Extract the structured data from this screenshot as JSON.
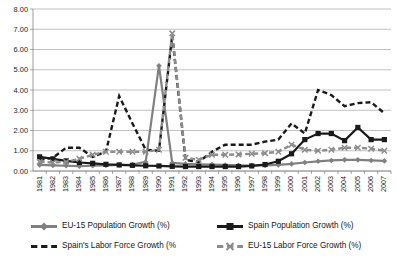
{
  "chart_data": {
    "type": "line",
    "title": "",
    "xlabel": "",
    "ylabel": "",
    "ylim": [
      0,
      8
    ],
    "ytick_step": 1,
    "grid": true,
    "legend_position": "bottom",
    "ytick_labels": [
      "0.00",
      "1.00",
      "2.00",
      "3.00",
      "4.00",
      "5.00",
      "6.00",
      "7.00",
      "8.00"
    ],
    "categories": [
      "1981",
      "1982",
      "1983",
      "1984",
      "1985",
      "1986",
      "1987",
      "1988",
      "1989",
      "1990",
      "1991",
      "1992",
      "1993",
      "1994",
      "1995",
      "1996",
      "1997",
      "1998",
      "1999",
      "2000",
      "2001",
      "2002",
      "2003",
      "2004",
      "2005",
      "2006",
      "2007"
    ],
    "series": [
      {
        "name": "EU-15 Population Growth (%)",
        "color": "#808080",
        "style": "solid",
        "marker": "diamond",
        "values": [
          0.3,
          0.28,
          0.26,
          0.24,
          0.26,
          0.28,
          0.3,
          0.32,
          0.45,
          5.2,
          0.4,
          0.35,
          0.33,
          0.32,
          0.3,
          0.28,
          0.27,
          0.28,
          0.3,
          0.35,
          0.42,
          0.48,
          0.52,
          0.55,
          0.55,
          0.52,
          0.5
        ]
      },
      {
        "name": "Spain Population Growth (%)",
        "color": "#1a1a1a",
        "style": "solid",
        "marker": "square",
        "values": [
          0.7,
          0.6,
          0.5,
          0.42,
          0.38,
          0.33,
          0.3,
          0.28,
          0.26,
          0.25,
          0.23,
          0.22,
          0.22,
          0.22,
          0.22,
          0.22,
          0.25,
          0.32,
          0.48,
          0.85,
          1.55,
          1.85,
          1.85,
          1.5,
          2.15,
          1.55,
          1.55
        ]
      },
      {
        "name": "Spain's Labor Force Growth (%)",
        "color": "#1a1a1a",
        "style": "dashed",
        "marker": "none",
        "values": [
          0.55,
          0.65,
          1.15,
          1.15,
          0.7,
          0.95,
          3.7,
          2.35,
          1.05,
          1.0,
          6.7,
          0.55,
          0.45,
          0.95,
          1.3,
          1.3,
          1.3,
          1.45,
          1.55,
          2.35,
          1.85,
          4.0,
          3.75,
          3.2,
          3.35,
          3.4,
          2.85
        ]
      },
      {
        "name": "EU-15 Labor Force Growth (%)",
        "color": "#8c8c8c",
        "style": "dashed",
        "marker": "x",
        "values": [
          0.45,
          0.42,
          0.45,
          0.6,
          0.8,
          0.95,
          0.95,
          0.95,
          0.95,
          1.05,
          6.8,
          0.65,
          0.55,
          0.8,
          0.8,
          0.82,
          0.85,
          0.88,
          0.95,
          1.3,
          1.05,
          1.0,
          1.05,
          1.15,
          1.15,
          1.1,
          1.0
        ]
      }
    ]
  },
  "legend": {
    "items": [
      {
        "label": "EU-15 Population Growth (%)",
        "series": 0
      },
      {
        "label": "Spain Population Growth (%)",
        "series": 1
      },
      {
        "label": "Spain's Labor Force Growth (%",
        "series": 2
      },
      {
        "label": "EU-15 Labor Force Growth (%)",
        "series": 3
      }
    ]
  }
}
